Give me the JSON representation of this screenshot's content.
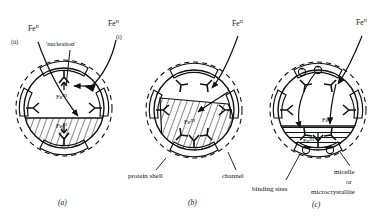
{
  "figure": {
    "panels": [
      {
        "id": "a",
        "caption": "(a)",
        "stage_labels": [
          {
            "name": "fe2-left",
            "text": "Fe",
            "superscript": "II",
            "x": 28,
            "y": 31
          },
          {
            "name": "path-ii",
            "text": "(ii)",
            "x": 13,
            "y": 43
          },
          {
            "name": "fe2-right",
            "text": "Fe",
            "superscript": "II",
            "x": 110,
            "y": 25
          },
          {
            "name": "path-i",
            "text": "(i)",
            "x": 118,
            "y": 38
          },
          {
            "name": "nucleation",
            "text": "'nucleation'",
            "x": 50,
            "y": 45
          },
          {
            "name": "fe3-nucleation",
            "text": "Fe",
            "superscript": "III",
            "x": 60,
            "y": 82
          },
          {
            "name": "fe3-core",
            "text": "Fe",
            "superscript": "III",
            "x": 61,
            "y": 123
          }
        ]
      },
      {
        "id": "b",
        "caption": "(b)",
        "stage_labels": [
          {
            "name": "fe2-top",
            "text": "Fe",
            "superscript": "II",
            "x": 234,
            "y": 25
          },
          {
            "name": "fe3-core",
            "text": "Fe",
            "superscript": "III",
            "x": 190,
            "y": 120
          },
          {
            "name": "protein-shell",
            "text": "protein shell",
            "x": 128,
            "y": 174
          },
          {
            "name": "channel",
            "text": "channel",
            "x": 222,
            "y": 174
          }
        ]
      },
      {
        "id": "c",
        "caption": "(c)",
        "stage_labels": [
          {
            "name": "fe2-top",
            "text": "Fe",
            "superscript": "II",
            "x": 360,
            "y": 24
          },
          {
            "name": "fe3-mid",
            "text": "Fe",
            "superscript": "III",
            "x": 327,
            "y": 117
          },
          {
            "name": "fe3-core",
            "text": "Fe",
            "superscript": "III",
            "x": 307,
            "y": 139
          },
          {
            "name": "binding-sites",
            "text": "binding sites",
            "x": 255,
            "y": 187
          },
          {
            "name": "micelle-line-1",
            "text": "micelle",
            "x": 336,
            "y": 173
          },
          {
            "name": "micelle-line-2",
            "text": "or",
            "x": 345,
            "y": 183
          },
          {
            "name": "micelle-line-3",
            "text": "microcrystallite",
            "x": 310,
            "y": 193
          }
        ]
      }
    ],
    "legend_terms": [
      "protein shell",
      "channel",
      "binding sites",
      "micelle or microcrystallite",
      "'nucleation'"
    ],
    "species": [
      "Fe II",
      "Fe III"
    ],
    "pathways": [
      "(i)",
      "(ii)"
    ],
    "colors": {
      "ink": "#111111",
      "background": "#ffffff",
      "hatch": "#111111"
    }
  }
}
